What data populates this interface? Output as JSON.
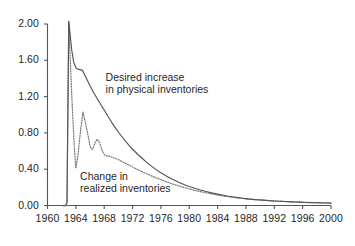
{
  "chart_data": {
    "type": "line",
    "title": "",
    "xlabel": "",
    "ylabel": "",
    "xlim": [
      1960,
      2000
    ],
    "ylim": [
      0.0,
      2.0
    ],
    "grid": false,
    "legend_position": "inline-annotations",
    "xticks": [
      1960,
      1964,
      1968,
      1972,
      1976,
      1980,
      1984,
      1988,
      1992,
      1996,
      2000
    ],
    "xtick_labels": [
      "1960",
      "1964",
      "1968",
      "1972",
      "1976",
      "1980",
      "1984",
      "1988",
      "1992",
      "1996",
      "2000"
    ],
    "yticks": [
      0.0,
      0.4,
      0.8,
      1.2,
      1.6,
      2.0
    ],
    "ytick_labels": [
      "0.00",
      "0.40",
      "0.80",
      "1.20",
      "1.60",
      "2.00"
    ],
    "annotations": [
      {
        "name": "desired-increase-label",
        "lines": [
          "Desired increase",
          "in physical inventories"
        ],
        "x": 1968.2,
        "y": 1.42
      },
      {
        "name": "change-realized-label",
        "lines": [
          "Change in",
          "realized inventories"
        ],
        "x": 1964.6,
        "y": 0.33
      }
    ],
    "series": [
      {
        "name": "Desired increase in physical inventories",
        "style": "solid",
        "color": "#555555",
        "x": [
          1960.0,
          1961.0,
          1962.0,
          1962.6,
          1962.75,
          1963.0,
          1963.15,
          1963.4,
          1963.7,
          1964.0,
          1964.4,
          1964.9,
          1965.3,
          1965.8,
          1966.4,
          1967.0,
          1967.7,
          1968.4,
          1969.2,
          1970.0,
          1971.0,
          1972.0,
          1973.0,
          1974.0,
          1975.0,
          1976.0,
          1977.0,
          1978.0,
          1979.0,
          1980.0,
          1981.0,
          1982.0,
          1983.0,
          1984.0,
          1985.0,
          1986.0,
          1987.0,
          1988.0,
          1989.0,
          1990.0,
          1991.0,
          1992.0,
          1993.0,
          1994.0,
          1995.0,
          1996.0,
          1997.0,
          1998.0,
          1999.0,
          2000.0
        ],
        "y": [
          0.0,
          0.0,
          0.0,
          0.0,
          0.04,
          2.03,
          1.92,
          1.72,
          1.58,
          1.52,
          1.5,
          1.49,
          1.43,
          1.35,
          1.26,
          1.18,
          1.09,
          1.0,
          0.9,
          0.81,
          0.71,
          0.62,
          0.545,
          0.475,
          0.415,
          0.36,
          0.315,
          0.275,
          0.24,
          0.21,
          0.185,
          0.162,
          0.142,
          0.125,
          0.11,
          0.097,
          0.086,
          0.076,
          0.068,
          0.062,
          0.056,
          0.05,
          0.046,
          0.042,
          0.038,
          0.035,
          0.032,
          0.03,
          0.028,
          0.026
        ]
      },
      {
        "name": "Change in realized inventories",
        "style": "dotted",
        "color": "#777777",
        "x": [
          1960.0,
          1961.0,
          1962.0,
          1962.6,
          1962.75,
          1963.0,
          1963.2,
          1963.5,
          1963.8,
          1964.0,
          1964.3,
          1964.7,
          1965.0,
          1965.3,
          1965.7,
          1966.0,
          1966.35,
          1966.7,
          1967.0,
          1967.3,
          1967.7,
          1968.1,
          1968.6,
          1969.2,
          1970.0,
          1971.0,
          1972.0,
          1973.0,
          1974.0,
          1975.0,
          1976.0,
          1977.0,
          1978.0,
          1979.0,
          1980.0,
          1981.0,
          1982.0,
          1983.0,
          1984.0,
          1985.0,
          1986.0,
          1987.0,
          1988.0,
          1989.0,
          1990.0,
          1991.0,
          1992.0,
          1993.0,
          1994.0,
          1995.0,
          1996.0,
          1997.0,
          1998.0,
          1999.0,
          2000.0
        ],
        "y": [
          0.0,
          0.0,
          0.0,
          0.0,
          0.03,
          2.03,
          1.62,
          1.08,
          0.62,
          0.41,
          0.56,
          0.85,
          1.03,
          0.93,
          0.78,
          0.66,
          0.62,
          0.69,
          0.73,
          0.7,
          0.61,
          0.555,
          0.545,
          0.53,
          0.505,
          0.465,
          0.425,
          0.385,
          0.35,
          0.315,
          0.285,
          0.255,
          0.228,
          0.205,
          0.183,
          0.163,
          0.145,
          0.13,
          0.115,
          0.103,
          0.092,
          0.082,
          0.073,
          0.066,
          0.06,
          0.054,
          0.05,
          0.046,
          0.042,
          0.039,
          0.036,
          0.034,
          0.032,
          0.03,
          0.028
        ]
      }
    ]
  },
  "axes": {
    "axis_color": "#555555",
    "tick_color": "#555555"
  }
}
